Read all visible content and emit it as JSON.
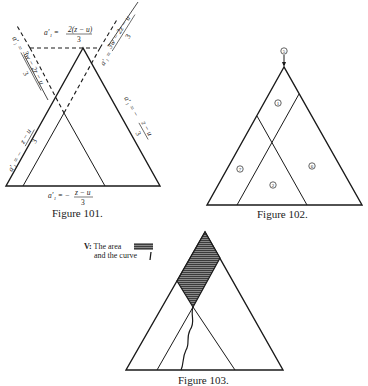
{
  "figures": [
    {
      "id": "fig101",
      "caption": "Figure 101.",
      "labels": {
        "top": "a′₁ = 2(z − u)/3",
        "top_lhs": "a′₁ =",
        "top_num": "2(z − u)",
        "top_den": "3",
        "upper_right": "a′₁ = 3w − 2z − u / 3",
        "upper_right_lhs": "a′₁ =",
        "upper_right_num": "3w − 2z − u",
        "upper_right_den": "3",
        "upper_left": "a′₁ = 3w − 2z − u / 3",
        "upper_left_lhs": "a′₁ =",
        "upper_left_num": "3w − 2z − u",
        "upper_left_den": "3",
        "left_side": "a′₁ = − z − u / 3",
        "left_lhs": "a′₁ = −",
        "left_num": "z − u",
        "left_den": "3",
        "right_side": "a′₁ = − z − u / 3",
        "right_lhs": "a′₁ = −",
        "right_num": "z − u",
        "right_den": "3",
        "bottom": "a′₁ = − z − u / 3",
        "bottom_lhs": "a′₁ = −",
        "bottom_num": "z − u",
        "bottom_den": "3"
      }
    },
    {
      "id": "fig102",
      "caption": "Figure 102.",
      "regions": [
        {
          "label": "1",
          "position": "top"
        },
        {
          "label": "7",
          "position": "left"
        },
        {
          "label": "2",
          "position": "bottom-center"
        },
        {
          "label": "6",
          "position": "right"
        },
        {
          "label": "5",
          "position": "apex-arrow"
        }
      ]
    },
    {
      "id": "fig103",
      "caption": "Figure 103.",
      "legend": {
        "line1_prefix": "V:",
        "line1": "The area",
        "line2": "and the curve"
      }
    }
  ],
  "colors": {
    "ink": "#1a1a1a",
    "hatch": "#555555",
    "background": "#ffffff"
  }
}
